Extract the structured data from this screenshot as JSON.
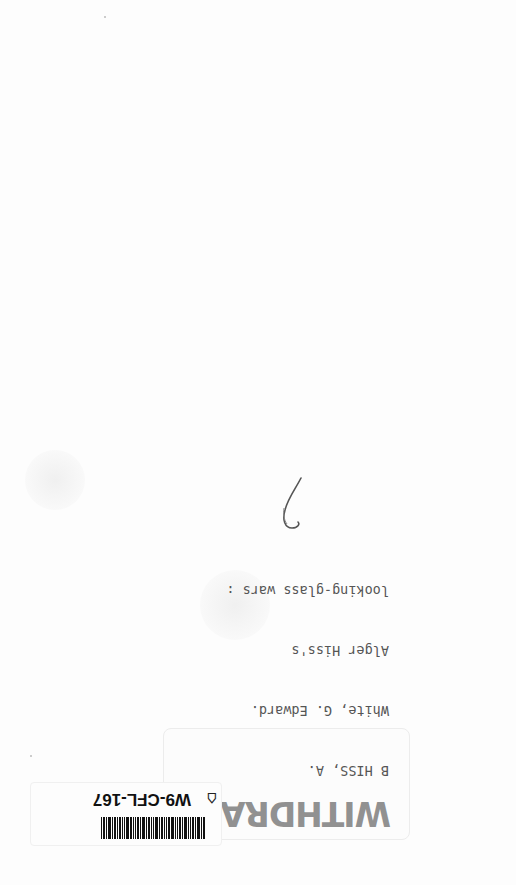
{
  "page": {
    "background": "#fdfdfd",
    "handwritten_mark": "6"
  },
  "label": {
    "orientation": "upside-down",
    "lines": [
      "B HISS, A.",
      "White, G. Edward.",
      "Alger Hiss's",
      "looking-glass wars :"
    ],
    "stamp": "WITHDRAWN"
  },
  "barcode": {
    "orientation": "upside-down",
    "id": "W9-CFL-167",
    "icon": "tag-icon"
  }
}
